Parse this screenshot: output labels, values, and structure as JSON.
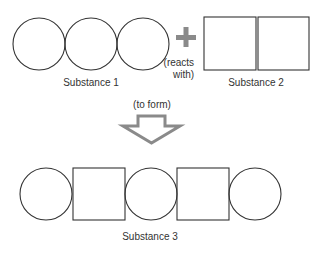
{
  "diagram": {
    "type": "chemical-reaction-schematic",
    "colors": {
      "outline": "#333333",
      "plus": "#8a8a8a",
      "arrow": "#8a8a8a",
      "text": "#333333",
      "background": "#ffffff"
    },
    "reactant1": {
      "label": "Substance 1",
      "shapes": [
        "circle",
        "circle",
        "circle"
      ]
    },
    "operator": {
      "symbol": "+",
      "caption_line1": "(reacts",
      "caption_line2": "with)"
    },
    "reactant2": {
      "label": "Substance 2",
      "shapes": [
        "square",
        "square"
      ]
    },
    "transition": {
      "caption": "(to form)",
      "icon": "down-arrow-icon"
    },
    "product": {
      "label": "Substance 3",
      "shapes": [
        "circle",
        "square",
        "circle",
        "square",
        "circle"
      ]
    }
  }
}
